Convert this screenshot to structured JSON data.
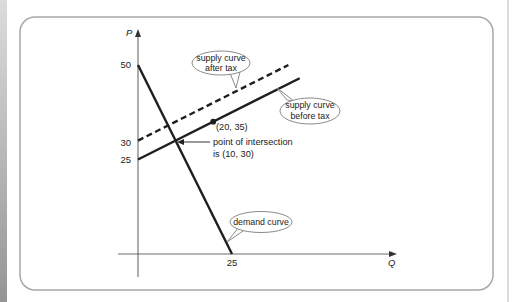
{
  "labels": {
    "axis_y": "P",
    "axis_x": "Q",
    "y_ticks": [
      "50",
      "30",
      "25"
    ],
    "x_ticks": [
      "25"
    ],
    "callout_after_tax": [
      "supply curve",
      "after tax"
    ],
    "callout_before_tax": [
      "supply curve",
      "before tax"
    ],
    "callout_demand": "demand curve",
    "point_label": "(20, 35)",
    "intersection_label": [
      "point of intersection",
      "is (10, 30)"
    ]
  },
  "colors": {
    "curve": "#1e1e1e",
    "axis": "#6a6a6a",
    "frame": "#a8a8a8",
    "bubble_border": "#8a8a8a"
  },
  "chart_data": {
    "type": "line",
    "title": "",
    "xlabel": "Q",
    "ylabel": "P",
    "x_ticks": [
      25
    ],
    "y_ticks": [
      25,
      30,
      50
    ],
    "xlim": [
      0,
      68
    ],
    "ylim": [
      0,
      60
    ],
    "grid": false,
    "legend": "callout labels on curves",
    "series": [
      {
        "name": "demand curve",
        "style": "solid",
        "points": [
          [
            0,
            50
          ],
          [
            25,
            0
          ]
        ]
      },
      {
        "name": "supply curve before tax",
        "style": "solid",
        "points": [
          [
            0,
            25
          ],
          [
            43,
            46.5
          ]
        ]
      },
      {
        "name": "supply curve after tax",
        "style": "dashed",
        "points": [
          [
            0,
            30
          ],
          [
            40,
            50
          ]
        ]
      }
    ],
    "marked_points": [
      {
        "label": "(20, 35)",
        "x": 20,
        "y": 35
      },
      {
        "label": "point of intersection is (10, 30)",
        "x": 10,
        "y": 30
      }
    ]
  }
}
